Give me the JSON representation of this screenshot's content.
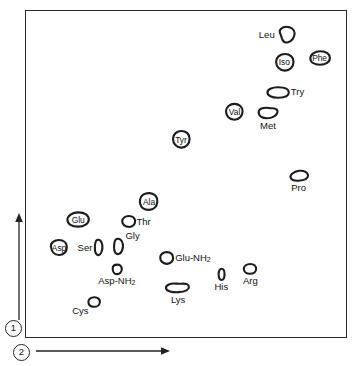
{
  "figure": {
    "type": "two-dimensional-paper-chromatogram",
    "background_color": "#ffffff",
    "frame_color": "#2b2b2b"
  },
  "axes": {
    "first_dimension": {
      "badge": "1",
      "direction": "up",
      "icon": "up-arrow-icon"
    },
    "second_dimension": {
      "badge": "2",
      "direction": "right",
      "icon": "right-arrow-icon"
    }
  },
  "chart_data": {
    "type": "scatter",
    "title": "",
    "xlabel": "2",
    "ylabel": "1",
    "xlim": [
      0,
      100
    ],
    "ylim": [
      0,
      100
    ],
    "grid": false,
    "legend": null,
    "note": "Spot positions given as percent of plot frame; x from left, y from top. Each spot is an irregular hand-drawn outline representing an amino acid on a 2-D chromatogram.",
    "points": [
      {
        "label": "Leu",
        "x": 81.0,
        "y": 7.5,
        "label_pos": "left",
        "shape": "blob-a",
        "w": 20,
        "h": 18
      },
      {
        "label": "Iso",
        "x": 80.5,
        "y": 16.0,
        "label_pos": "inside",
        "shape": "blob-b",
        "w": 21,
        "h": 19
      },
      {
        "label": "Phe",
        "x": 91.5,
        "y": 14.5,
        "label_pos": "inside",
        "shape": "blob-c",
        "w": 22,
        "h": 16
      },
      {
        "label": "Try",
        "x": 78.5,
        "y": 25.0,
        "label_pos": "right",
        "shape": "blob-d",
        "w": 24,
        "h": 13
      },
      {
        "label": "Val",
        "x": 65.0,
        "y": 31.0,
        "label_pos": "inside",
        "shape": "blob-b",
        "w": 20,
        "h": 18
      },
      {
        "label": "Met",
        "x": 75.5,
        "y": 31.5,
        "label_pos": "below",
        "shape": "blob-e",
        "w": 22,
        "h": 14
      },
      {
        "label": "Tyr",
        "x": 48.5,
        "y": 39.5,
        "label_pos": "inside",
        "shape": "blob-b",
        "w": 20,
        "h": 19
      },
      {
        "label": "Pro",
        "x": 85.0,
        "y": 50.5,
        "label_pos": "below",
        "shape": "blob-f",
        "w": 20,
        "h": 13
      },
      {
        "label": "Ala",
        "x": 38.5,
        "y": 58.5,
        "label_pos": "inside",
        "shape": "blob-g",
        "w": 21,
        "h": 19
      },
      {
        "label": "Glu",
        "x": 16.5,
        "y": 64.0,
        "label_pos": "inside",
        "shape": "blob-c",
        "w": 24,
        "h": 17
      },
      {
        "label": "Thr",
        "x": 32.0,
        "y": 64.5,
        "label_pos": "right",
        "shape": "blob-h",
        "w": 15,
        "h": 13
      },
      {
        "label": "Asp",
        "x": 10.5,
        "y": 72.5,
        "label_pos": "inside",
        "shape": "blob-i",
        "w": 19,
        "h": 17
      },
      {
        "label": "Ser",
        "x": 23.0,
        "y": 72.5,
        "label_pos": "left",
        "shape": "oval-t",
        "w": 11,
        "h": 17
      },
      {
        "label": "Gly",
        "x": 29.5,
        "y": 72.0,
        "label_pos": "upright",
        "shape": "oval-t",
        "w": 13,
        "h": 17
      },
      {
        "label": "Glu-NH2",
        "x": 44.0,
        "y": 75.5,
        "label_pos": "right",
        "shape": "blob-h",
        "w": 15,
        "h": 14
      },
      {
        "label": "Asp-NH2",
        "x": 28.5,
        "y": 79.0,
        "label_pos": "below",
        "shape": "oval-s",
        "w": 12,
        "h": 11
      },
      {
        "label": "His",
        "x": 61.0,
        "y": 80.5,
        "label_pos": "below",
        "shape": "oval-n",
        "w": 9,
        "h": 13
      },
      {
        "label": "Arg",
        "x": 70.0,
        "y": 79.0,
        "label_pos": "below",
        "shape": "oval-w",
        "w": 14,
        "h": 12
      },
      {
        "label": "Lys",
        "x": 47.5,
        "y": 84.5,
        "label_pos": "below",
        "shape": "blob-j",
        "w": 25,
        "h": 13
      },
      {
        "label": "Cys",
        "x": 21.5,
        "y": 89.0,
        "label_pos": "lowleft",
        "shape": "blob-k",
        "w": 14,
        "h": 12
      }
    ]
  }
}
